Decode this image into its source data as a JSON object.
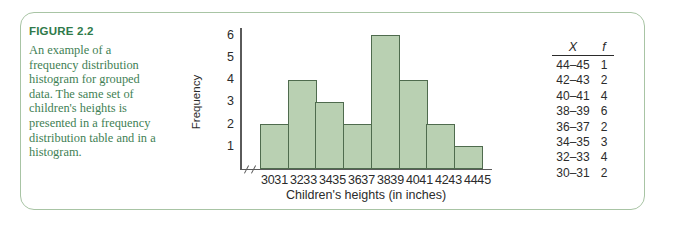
{
  "figure": {
    "label": "FIGURE 2.2",
    "caption": "An example of a frequency distribution histogram for grouped data. The same set of children's heights is presented in a frequency distribution table and in a histogram."
  },
  "colors": {
    "frame_border": "#a8c4a4",
    "caption_heading": "#2f7a4a",
    "caption_body": "#3f7f55",
    "bar_fill": "#b9d0b2",
    "bar_stroke": "#4f6b4e",
    "axis": "#5a5a5a",
    "text": "#2b2b2b"
  },
  "table": {
    "headers": [
      "X",
      "f"
    ],
    "rows": [
      {
        "x": "44–45",
        "f": "1"
      },
      {
        "x": "42–43",
        "f": "2"
      },
      {
        "x": "40–41",
        "f": "4"
      },
      {
        "x": "38–39",
        "f": "6"
      },
      {
        "x": "36–37",
        "f": "2"
      },
      {
        "x": "34–35",
        "f": "3"
      },
      {
        "x": "32–33",
        "f": "4"
      },
      {
        "x": "30–31",
        "f": "2"
      }
    ]
  },
  "chart_data": {
    "type": "bar",
    "title": "",
    "xlabel": "Children's heights (in inches)",
    "ylabel": "Frequency",
    "categories": [
      "30–31",
      "32–33",
      "34–35",
      "36–37",
      "38–39",
      "40–41",
      "42–43",
      "44–45"
    ],
    "values": [
      2,
      4,
      3,
      2,
      6,
      4,
      2,
      1
    ],
    "x_tick_labels": [
      "30",
      "31",
      "32",
      "33",
      "34",
      "35",
      "36",
      "37",
      "38",
      "39",
      "40",
      "41",
      "42",
      "43",
      "44",
      "45"
    ],
    "y_tick_labels": [
      "6",
      "5",
      "4",
      "3",
      "2",
      "1"
    ],
    "ylim": [
      0,
      6.3
    ],
    "grid": false,
    "legend": false,
    "axis_break": true
  }
}
